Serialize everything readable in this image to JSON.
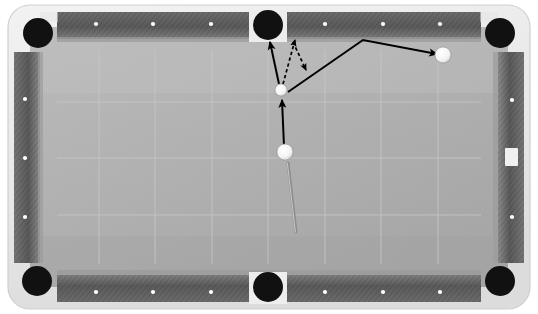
{
  "scene": {
    "title": "Pool table shot diagram",
    "width": 538,
    "height": 314
  },
  "colors": {
    "background": "#ffffff",
    "frame": "#e9e9e9",
    "frame_shadow": "#c9c9c9",
    "rail_dark": "#5d5d5d",
    "rail_light": "#8f8f8f",
    "rail_edge": "#a9a9a9",
    "cloth": "#b0b0b0",
    "cloth_light": "#bcbcbc",
    "cloth_shadow": "#a2a2a2",
    "grid_line": "#c2c2c2",
    "pocket": "#111111",
    "pocket_notch": "#ededed",
    "diamond": "#ffffff",
    "ball_white": "#ffffff",
    "ball_edge": "#9a9a9a",
    "line_solid": "#000000",
    "line_dashed": "#000000",
    "cue_stick": "#8a8a8a"
  },
  "table": {
    "frame": {
      "x": 8,
      "y": 5,
      "width": 522,
      "height": 304,
      "radius": 22
    },
    "cloth": {
      "x": 32,
      "y": 29,
      "width": 474,
      "height": 256
    },
    "playfield": {
      "x": 57,
      "y": 50,
      "width": 424,
      "height": 214
    },
    "rails": [
      {
        "name": "rail-top",
        "x": 57,
        "y": 12,
        "width": 424,
        "height": 27
      },
      {
        "name": "rail-bottom",
        "x": 57,
        "y": 275,
        "width": 424,
        "height": 27
      },
      {
        "name": "rail-left",
        "x": 14,
        "y": 52,
        "width": 26,
        "height": 211
      },
      {
        "name": "rail-right",
        "x": 498,
        "y": 52,
        "width": 26,
        "height": 211
      }
    ]
  },
  "pockets": [
    {
      "name": "pocket-top-left",
      "cx": 38,
      "cy": 33,
      "r": 15
    },
    {
      "name": "pocket-top-center",
      "cx": 268,
      "cy": 25,
      "r": 15
    },
    {
      "name": "pocket-top-right",
      "cx": 500,
      "cy": 33,
      "r": 15
    },
    {
      "name": "pocket-bottom-left",
      "cx": 37,
      "cy": 281,
      "r": 15
    },
    {
      "name": "pocket-bottom-center",
      "cx": 268,
      "cy": 287,
      "r": 15
    },
    {
      "name": "pocket-bottom-right",
      "cx": 500,
      "cy": 281,
      "r": 15
    }
  ],
  "diamonds": {
    "top": [
      {
        "cx": 96,
        "cy": 24
      },
      {
        "cx": 153,
        "cy": 24
      },
      {
        "cx": 211,
        "cy": 24
      },
      {
        "cx": 325,
        "cy": 24
      },
      {
        "cx": 383,
        "cy": 24
      },
      {
        "cx": 440,
        "cy": 24
      }
    ],
    "bottom": [
      {
        "cx": 96,
        "cy": 292
      },
      {
        "cx": 153,
        "cy": 292
      },
      {
        "cx": 211,
        "cy": 292
      },
      {
        "cx": 325,
        "cy": 292
      },
      {
        "cx": 383,
        "cy": 292
      },
      {
        "cx": 440,
        "cy": 292
      }
    ],
    "left": [
      {
        "cx": 25,
        "cy": 99
      },
      {
        "cx": 25,
        "cy": 158
      },
      {
        "cx": 25,
        "cy": 217
      }
    ],
    "right": [
      {
        "cx": 512,
        "cy": 100
      },
      {
        "cx": 512,
        "cy": 217
      }
    ]
  },
  "rail_marker": {
    "name": "rail-chalk-patch",
    "x": 505,
    "y": 148,
    "width": 13,
    "height": 18
  },
  "grid": {
    "vertical_x": [
      99,
      155,
      212,
      268,
      325,
      381,
      438
    ],
    "horizontal_y": [
      102,
      158,
      215
    ]
  },
  "balls": [
    {
      "name": "cue-ball",
      "label": "Cue ball",
      "cx": 285,
      "cy": 152,
      "r": 8
    },
    {
      "name": "object-ball",
      "label": "Object ball",
      "cx": 281,
      "cy": 90,
      "r": 6
    },
    {
      "name": "target-ball-right",
      "label": "Second object ball",
      "cx": 443,
      "cy": 55,
      "r": 8
    }
  ],
  "cue_stick": {
    "name": "cue-stick",
    "x1": 288,
    "y1": 163,
    "x2": 296,
    "y2": 232,
    "width": 3
  },
  "paths": [
    {
      "name": "cue-ball-path",
      "style": "solid",
      "points": [
        [
          284,
          146
        ],
        [
          282,
          100
        ]
      ],
      "arrow_end": true,
      "description": "Cue ball travels up into the object ball"
    },
    {
      "name": "object-ball-to-pocket-path",
      "style": "solid",
      "points": [
        [
          279,
          84
        ],
        [
          270,
          42
        ]
      ],
      "arrow_end": true,
      "description": "Object ball cut into the top-center pocket"
    },
    {
      "name": "cue-ball-tangent-path",
      "style": "dashed",
      "points": [
        [
          283,
          84
        ],
        [
          295,
          40
        ]
      ],
      "arrow_end": true,
      "description": "Dashed tangent / follow direction up toward the rail"
    },
    {
      "name": "cue-ball-deflection-path",
      "style": "dashed",
      "points": [
        [
          293,
          42
        ],
        [
          306,
          70
        ]
      ],
      "arrow_end": true,
      "description": "Dashed deflection coming off the rail"
    },
    {
      "name": "cue-ball-carom-path",
      "style": "solid",
      "points": [
        [
          288,
          92
        ],
        [
          363,
          40
        ],
        [
          437,
          54
        ]
      ],
      "arrow_end": true,
      "description": "Cue ball carom off the top rail into the second object ball"
    }
  ]
}
